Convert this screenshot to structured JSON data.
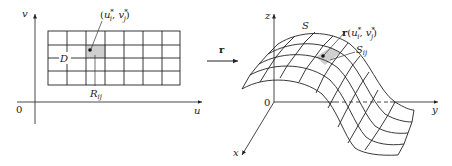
{
  "diagram": {
    "left_panel": {
      "axis_labels": {
        "vertical": "v",
        "horizontal": "u",
        "origin": "0"
      },
      "region_label": "D",
      "subrectangle_label": {
        "main": "R",
        "sub": "ij"
      },
      "sample_point_label": {
        "open": "(",
        "var1": "u",
        "sub1": "i",
        "sep": ", ",
        "var2": "v",
        "sub2": "j",
        "star": "*",
        "close": ")"
      },
      "grid": {
        "columns": 7,
        "rows": 4
      }
    },
    "mapping": {
      "label": "r"
    },
    "right_panel": {
      "axis_labels": {
        "z": "z",
        "y": "y",
        "x": "x",
        "origin": "0"
      },
      "surface_label": "S",
      "patch_label": {
        "main": "S",
        "sub": "ij"
      },
      "image_point_label": {
        "func": "r",
        "open": "(",
        "var1": "u",
        "sub1": "i",
        "sep": ", ",
        "var2": "v",
        "sub2": "j",
        "star": "*",
        "close": ")"
      }
    },
    "colors": {
      "line": "#222222",
      "shade": "#cfcfcf",
      "background": "#ffffff"
    }
  }
}
